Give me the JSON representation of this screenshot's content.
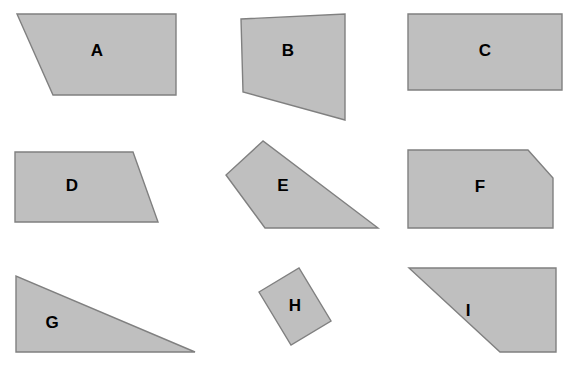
{
  "page": {
    "background_color": "#ffffff",
    "width": 570,
    "height": 367
  },
  "style": {
    "shape_fill": "#bfbfbf",
    "shape_stroke": "#808080",
    "label_color": "#000000"
  },
  "shapes": [
    {
      "label": "A",
      "kind": "quadrilateral",
      "points": "17,14 176,14 176,95 53,95",
      "label_x": 97,
      "label_y": 52
    },
    {
      "label": "B",
      "kind": "quadrilateral",
      "points": "241,19 345,14 345,120 243,92",
      "label_x": 288,
      "label_y": 52
    },
    {
      "label": "C",
      "kind": "rectangle",
      "points": "408,14 562,14 562,90 408,90",
      "label_x": 485,
      "label_y": 52
    },
    {
      "label": "D",
      "kind": "trapezoid",
      "points": "15,152 133,152 158,222 15,222",
      "label_x": 72,
      "label_y": 187
    },
    {
      "label": "E",
      "kind": "quadrilateral",
      "points": "263,141 226,175 265,228 378,228",
      "label_x": 283,
      "label_y": 187
    },
    {
      "label": "F",
      "kind": "pentagon",
      "points": "408,150 528,150 553,178 553,228 408,228",
      "label_x": 480,
      "label_y": 188
    },
    {
      "label": "G",
      "kind": "right-triangle",
      "points": "16,276 16,352 195,352",
      "label_x": 52,
      "label_y": 324
    },
    {
      "label": "H",
      "kind": "rotated-rectangle",
      "points": "259,292 299,268 331,321 291,345",
      "label_x": 295,
      "label_y": 307
    },
    {
      "label": "I",
      "kind": "quadrilateral",
      "points": "409,268 556,268 556,352 500,352",
      "label_x": 468,
      "label_y": 312
    }
  ]
}
